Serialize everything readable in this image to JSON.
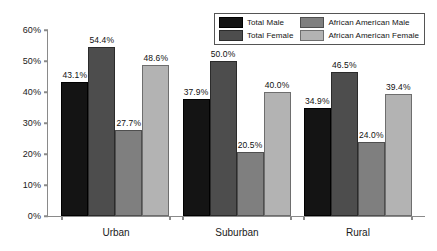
{
  "chart_data": {
    "type": "bar",
    "title": "",
    "xlabel": "",
    "ylabel": "",
    "ylim": [
      0,
      60
    ],
    "ytick_step": 10,
    "grid": false,
    "legend_position": "top-right",
    "categories": [
      "Urban",
      "Suburban",
      "Rural"
    ],
    "ytick_labels": [
      "0%",
      "10%",
      "20%",
      "30%",
      "40%",
      "50%",
      "60%"
    ],
    "ytick_values": [
      0,
      10,
      20,
      30,
      40,
      50,
      60
    ],
    "series": [
      {
        "name": "Total Male",
        "color": "#141414",
        "values": [
          43.1,
          37.9,
          34.9
        ],
        "labels": [
          "43.1%",
          "37.9%",
          "34.9%"
        ]
      },
      {
        "name": "Total Female",
        "color": "#4d4d4d",
        "values": [
          54.4,
          50.0,
          46.5
        ],
        "labels": [
          "54.4%",
          "50.0%",
          "46.5%"
        ]
      },
      {
        "name": "African American Male",
        "color": "#7f7f7f",
        "values": [
          27.7,
          20.5,
          24.0
        ],
        "labels": [
          "27.7%",
          "20.5%",
          "24.0%"
        ]
      },
      {
        "name": "African American Female",
        "color": "#b3b3b3",
        "values": [
          48.6,
          40.0,
          39.4
        ],
        "labels": [
          "48.6%",
          "40.0%",
          "39.4%"
        ]
      }
    ]
  }
}
